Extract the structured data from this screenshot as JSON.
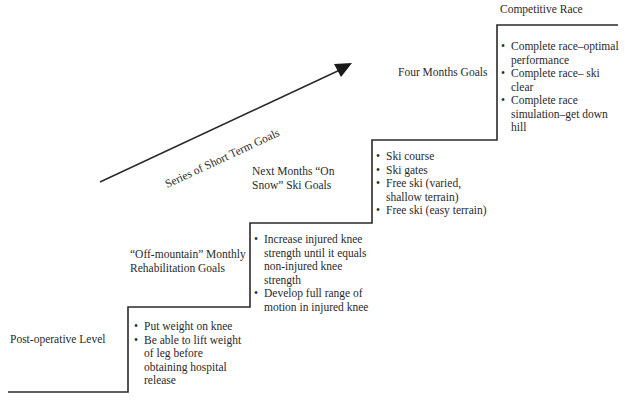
{
  "diagram": {
    "type": "staircase-goal-progression",
    "arrow": {
      "label": "Series of Short Term Goals",
      "direction": "up-right"
    },
    "stages": [
      {
        "title": "Post-operative Level",
        "goals": [
          "Put weight on knee",
          "Be able to lift weight of leg before obtaining hospital release"
        ]
      },
      {
        "title": "“Off-mountain” Monthly Rehabilitation Goals",
        "goals": [
          "Increase injured knee strength until it equals non-injured knee strength",
          "Develop full range of motion in injured knee"
        ]
      },
      {
        "title": "Next Months “On Snow” Ski Goals",
        "goals": [
          "Ski course",
          "Ski gates",
          "Free ski (varied, shallow terrain)",
          "Free ski (easy terrain)"
        ]
      },
      {
        "title": "Four Months Goals",
        "goals": [
          "Complete race–optimal performance",
          "Complete race– ski clear",
          "Complete race simulation–get down hill"
        ]
      },
      {
        "title": "Competitive Race",
        "goals": []
      }
    ],
    "caption_partial": "...goal setting for rehabilitation"
  },
  "colors": {
    "line": "#2a2a2a",
    "text": "#2a2a2a",
    "background": "#ffffff"
  }
}
